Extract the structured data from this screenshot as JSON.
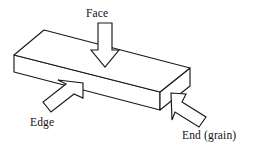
{
  "figure": {
    "background_color": "#ffffff",
    "line_color": "#1a1a1a",
    "fill_color": "#ffffff",
    "width": 256,
    "height": 149
  },
  "labels": {
    "face": "Face",
    "edge": "Edge",
    "end": "End  (grain)"
  },
  "annotations": [
    {
      "id": "face",
      "label": "Face",
      "direction": "down",
      "points_to": "top-face-of-board",
      "icon": "down-arrow-icon"
    },
    {
      "id": "edge",
      "label": "Edge",
      "direction": "up-right",
      "points_to": "front-long-edge-face-of-board",
      "icon": "up-right-arrow-icon"
    },
    {
      "id": "end",
      "label": "End  (grain)",
      "direction": "up-left",
      "points_to": "right-end-grain-face-of-board",
      "icon": "up-left-arrow-icon"
    }
  ],
  "geometry": {
    "top_face": "14,55 44,30 190,68 160,92",
    "left_end_face": "14,55 14,72 160,110 160,92",
    "front_face": "14,72 160,110 190,86 190,68",
    "right_end_face": "160,92 190,68 190,86 160,110"
  }
}
